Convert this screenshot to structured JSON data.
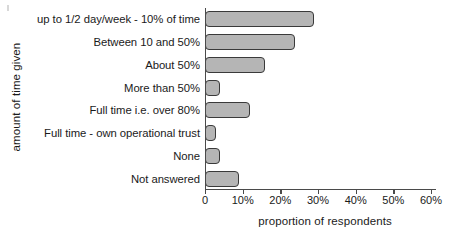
{
  "chart_data": {
    "type": "bar",
    "orientation": "horizontal",
    "title": "",
    "xlabel": "proportion of respondents",
    "ylabel": "amount of time given",
    "categories": [
      "up to 1/2 day/week - 10% of time",
      "Between 10 and 50%",
      "About 50%",
      "More than 50%",
      "Full time i.e. over 80%",
      "Full time - own operational trust",
      "None",
      "Not answered"
    ],
    "values": [
      29,
      24,
      16,
      4,
      12,
      3,
      4,
      9
    ],
    "xlim": [
      0,
      60
    ],
    "xtick_values": [
      0,
      10,
      20,
      30,
      40,
      50,
      60
    ],
    "xtick_labels": [
      "0",
      "10%",
      "20%",
      "30%",
      "40%",
      "50%",
      "60%"
    ],
    "grid": false,
    "legend": null,
    "bar_fill_color": "#b5b5b5",
    "bar_edge_color": "#3a3a3a",
    "axis_color": "#4a4a4a",
    "background_color": "#ffffff"
  }
}
